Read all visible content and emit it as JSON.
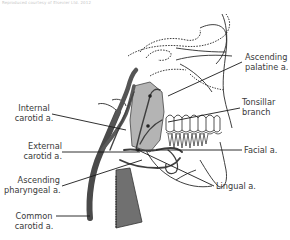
{
  "caption": "Reproduced courtesy of Elsevier Ltd. 2012",
  "diagram": {
    "colors": {
      "artery_dark": "#4a4a4a",
      "artery_mid": "#6e6e6e",
      "pharynx_fill": "#b4b4b4",
      "bone_outline": "#2a2a2a",
      "label_text": "#3a3a3a",
      "background": "#ffffff"
    },
    "labels": {
      "ascending_palatine": {
        "line1": "Ascending",
        "line2": "palatine a."
      },
      "tonsillar_branch": {
        "line1": "Tonsillar",
        "line2": "branch"
      },
      "facial": {
        "line1": "Facial a."
      },
      "lingual": {
        "line1": "Lingual a."
      },
      "internal_carotid": {
        "line1": "Internal",
        "line2": "carotid a."
      },
      "external_carotid": {
        "line1": "External",
        "line2": "carotid a."
      },
      "ascending_pharyngeal": {
        "line1": "Ascending",
        "line2": "pharyngeal a."
      },
      "common_carotid": {
        "line1": "Common",
        "line2": "carotid a."
      }
    }
  }
}
